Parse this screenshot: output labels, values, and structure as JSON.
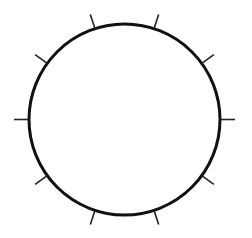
{
  "diagram": {
    "type": "circle-with-ticks",
    "circle": {
      "cx": 124.5,
      "cy": 119.5,
      "r": 95.5,
      "stroke": "#111111"
    },
    "ticks": {
      "count": 10,
      "start_angle_deg": 0,
      "step_deg": 36,
      "length": 15,
      "stroke": "#222222"
    }
  }
}
